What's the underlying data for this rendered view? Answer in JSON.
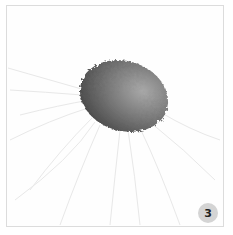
{
  "image": {
    "subject": "gray ink blot with faint radiating strands on white card",
    "colors": {
      "background": "#ffffff",
      "frame_border": "#dcdcdc",
      "blot_dark": "#4a4a4a",
      "blot_light": "#9a9a9a",
      "strands": "#e6e6e6",
      "badge_bg": "#d4d4d4"
    }
  },
  "badge": {
    "label": "3"
  }
}
